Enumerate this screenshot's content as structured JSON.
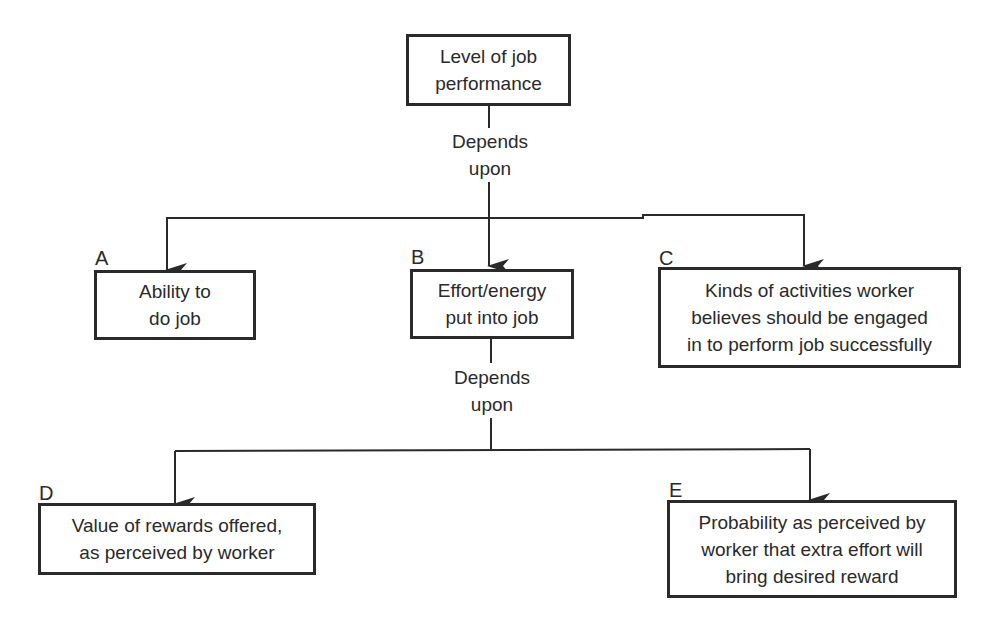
{
  "diagram": {
    "root": {
      "text": "Level of job\nperformance"
    },
    "depends_label_1": "Depends\nupon",
    "depends_label_2": "Depends\nupon",
    "nodes": [
      {
        "letter": "A",
        "text": "Ability to\ndo job"
      },
      {
        "letter": "B",
        "text": "Effort/energy\nput into job"
      },
      {
        "letter": "C",
        "text": "Kinds of activities worker\nbelieves should be engaged\nin to perform job successfully"
      },
      {
        "letter": "D",
        "text": "Value of rewards offered,\nas perceived by worker"
      },
      {
        "letter": "E",
        "text": "Probability as perceived by\nworker that extra effort will\nbring desired reward"
      }
    ],
    "edges": [
      {
        "from": "Level of job performance",
        "to": "A",
        "label": "Depends upon"
      },
      {
        "from": "Level of job performance",
        "to": "B",
        "label": "Depends upon"
      },
      {
        "from": "Level of job performance",
        "to": "C",
        "label": "Depends upon"
      },
      {
        "from": "B",
        "to": "D",
        "label": "Depends upon"
      },
      {
        "from": "B",
        "to": "E",
        "label": "Depends upon"
      }
    ],
    "line_color": "#2a2a2a"
  }
}
